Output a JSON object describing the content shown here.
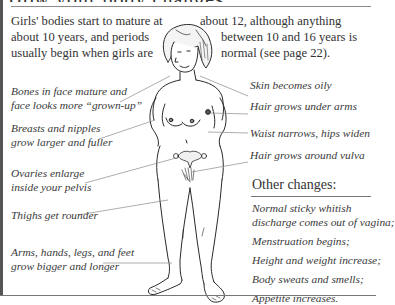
{
  "heading": {
    "text": "How your body changes"
  },
  "intro": {
    "left_lines": [
      "Girls' bodies start to mature at",
      "about 10 years, and periods",
      "usually begin when girls are"
    ],
    "right_lines": [
      "about 12, although anything",
      "between 10 and 16 years is",
      "normal (see page 22)."
    ]
  },
  "left_labels": [
    {
      "lines": [
        "Bones in face mature and",
        "face looks more “grown-up”"
      ]
    },
    {
      "lines": [
        "Breasts and nipples",
        "grow larger and fuller"
      ]
    },
    {
      "lines": [
        "Ovaries enlarge",
        "inside your pelvis"
      ]
    },
    {
      "lines": [
        "Thighs get rounder"
      ]
    },
    {
      "lines": [
        "Arms, hands, legs, and feet",
        "grow bigger and longer"
      ]
    }
  ],
  "right_labels": [
    {
      "text": "Skin becomes oily"
    },
    {
      "text": "Hair grows under arms"
    },
    {
      "text": "Waist narrows, hips widen"
    },
    {
      "text": "Hair grows around vulva"
    }
  ],
  "other_changes": {
    "title": "Other changes:",
    "items": [
      [
        "Normal sticky whitish",
        "discharge comes out of vagina;"
      ],
      [
        "Menstruation begins;"
      ],
      [
        "Height and weight increase;"
      ],
      [
        "Body sweats and smells;"
      ],
      [
        "Appetite increases."
      ]
    ]
  },
  "colors": {
    "text": "#333333",
    "line": "#8a8a8a",
    "border": "#555555"
  }
}
